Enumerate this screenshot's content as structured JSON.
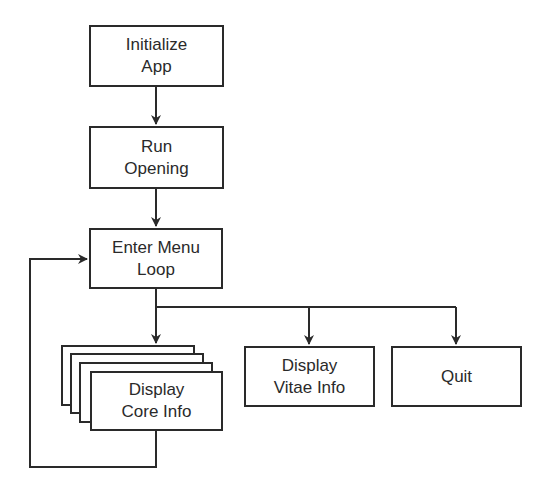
{
  "diagram": {
    "type": "flowchart",
    "colors": {
      "stroke": "#2a2a2a",
      "fill": "#ffffff",
      "text": "#2a2a2a"
    },
    "nodes": {
      "initialize": {
        "line1": "Initialize",
        "line2": "App"
      },
      "opening": {
        "line1": "Run",
        "line2": "Opening"
      },
      "menu": {
        "line1": "Enter Menu",
        "line2": "Loop"
      },
      "core": {
        "line1": "Display",
        "line2": "Core Info",
        "stacked": true
      },
      "vitae": {
        "line1": "Display",
        "line2": "Vitae Info"
      },
      "quit": {
        "line1": "Quit"
      }
    },
    "edges": [
      {
        "from": "Initialize App",
        "to": "Run Opening"
      },
      {
        "from": "Run Opening",
        "to": "Enter Menu Loop"
      },
      {
        "from": "Enter Menu Loop",
        "to": "Display Core Info"
      },
      {
        "from": "Enter Menu Loop",
        "to": "Display Vitae Info"
      },
      {
        "from": "Enter Menu Loop",
        "to": "Quit"
      },
      {
        "from": "Display Core Info",
        "to": "Enter Menu Loop",
        "kind": "loop-back"
      }
    ]
  }
}
